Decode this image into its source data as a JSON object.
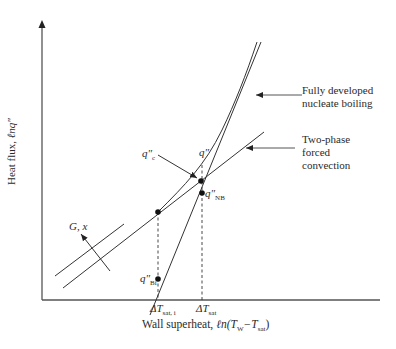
{
  "diagram": {
    "axes": {
      "y_label_text": "Heat flux, ",
      "y_label_math": "ℓnq″",
      "x_label_text": "Wall superheat, ",
      "x_label_math_prefix": "ℓn(T",
      "x_label_sub1": "W",
      "x_label_mid": "−T",
      "x_label_sub2": "sat",
      "x_label_close": ")"
    },
    "annotations": {
      "nucleate_boiling_line1": "Fully developed",
      "nucleate_boiling_line2": "nucleate boiling",
      "forced_convection_line1": "Two-phase",
      "forced_convection_line2": "forced",
      "forced_convection_line3": "convection",
      "gx_label": "G, x"
    },
    "points": {
      "qc_symbol": "q″",
      "qc_sub": "c",
      "q_symbol": "q″",
      "qnb_symbol": "q″",
      "qnb_sub": "NB",
      "qbi_symbol": "q″",
      "qbi_sub": "Bi"
    },
    "ticks": {
      "dt_sat_i_symbol": "ΔT",
      "dt_sat_i_sub": "sat, i",
      "dt_sat_symbol": "ΔT",
      "dt_sat_sub": "sat"
    },
    "colors": {
      "line": "#333333",
      "axis": "#555555"
    }
  }
}
